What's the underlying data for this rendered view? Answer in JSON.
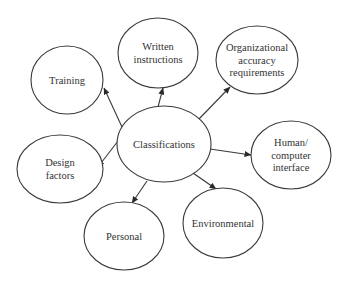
{
  "diagram": {
    "type": "hub-and-spoke",
    "center": {
      "id": "classifications",
      "lines": [
        "Classifications"
      ],
      "cx": 164,
      "cy": 144,
      "rx": 47,
      "ry": 38
    },
    "nodes": [
      {
        "id": "training",
        "lines": [
          "Training"
        ],
        "cx": 67,
        "cy": 80,
        "rx": 36,
        "ry": 34
      },
      {
        "id": "written-instructions",
        "lines": [
          "Written",
          "instructions"
        ],
        "cx": 158,
        "cy": 53,
        "rx": 40,
        "ry": 35
      },
      {
        "id": "organizational-accuracy-requirements",
        "lines": [
          "Organizational",
          "accuracy",
          "requirements"
        ],
        "cx": 257,
        "cy": 60,
        "rx": 41,
        "ry": 34
      },
      {
        "id": "human-computer-interface",
        "lines": [
          "Human/",
          "computer",
          "interface"
        ],
        "cx": 291,
        "cy": 155,
        "rx": 40,
        "ry": 34
      },
      {
        "id": "environmental",
        "lines": [
          "Environmental"
        ],
        "cx": 223,
        "cy": 223,
        "rx": 40,
        "ry": 35
      },
      {
        "id": "personal",
        "lines": [
          "Personal"
        ],
        "cx": 124,
        "cy": 236,
        "rx": 40,
        "ry": 34
      },
      {
        "id": "design-factors",
        "lines": [
          "Design",
          "factors"
        ],
        "cx": 60,
        "cy": 169,
        "rx": 43,
        "ry": 34
      }
    ],
    "edges": [
      {
        "from": "classifications",
        "to": "training",
        "x1": 122,
        "y1": 127,
        "x2": 104,
        "y2": 88
      },
      {
        "from": "classifications",
        "to": "written-instructions",
        "x1": 158,
        "y1": 107,
        "x2": 163,
        "y2": 88
      },
      {
        "from": "classifications",
        "to": "organizational-accuracy-requirements",
        "x1": 198,
        "y1": 120,
        "x2": 230,
        "y2": 87
      },
      {
        "from": "classifications",
        "to": "human-computer-interface",
        "x1": 210,
        "y1": 149,
        "x2": 251,
        "y2": 155
      },
      {
        "from": "classifications",
        "to": "environmental",
        "x1": 193,
        "y1": 173,
        "x2": 216,
        "y2": 189
      },
      {
        "from": "classifications",
        "to": "personal",
        "x1": 147,
        "y1": 181,
        "x2": 132,
        "y2": 203
      },
      {
        "from": "classifications",
        "to": "design-factors",
        "x1": 118,
        "y1": 141,
        "x2": 98,
        "y2": 167
      }
    ],
    "colors": {
      "stroke": "#3a3a3a",
      "text": "#333333",
      "background": "#ffffff"
    }
  }
}
